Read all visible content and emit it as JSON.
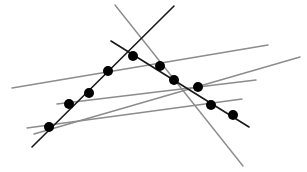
{
  "diagram": {
    "width": 307,
    "height": 172,
    "background": "#ffffff",
    "colors": {
      "dark_line": "#1a1a1a",
      "gray_line": "#8c8c8c",
      "point": "#000000"
    },
    "lines": [
      {
        "id": "dark-line-1",
        "kind": "dark",
        "x1": 32,
        "y1": 147,
        "x2": 174,
        "y2": 6
      },
      {
        "id": "dark-line-2",
        "kind": "dark",
        "x1": 111,
        "y1": 41,
        "x2": 249,
        "y2": 127
      },
      {
        "id": "gray-line-1",
        "kind": "gray",
        "x1": 115,
        "y1": 5,
        "x2": 243,
        "y2": 166
      },
      {
        "id": "gray-line-2",
        "kind": "gray",
        "x1": 12,
        "y1": 88,
        "x2": 268,
        "y2": 45
      },
      {
        "id": "gray-line-3",
        "kind": "gray",
        "x1": 34,
        "y1": 134,
        "x2": 300,
        "y2": 57
      },
      {
        "id": "gray-line-4",
        "kind": "gray",
        "x1": 57,
        "y1": 104,
        "x2": 256,
        "y2": 80
      },
      {
        "id": "gray-line-5",
        "kind": "gray",
        "x1": 27,
        "y1": 128,
        "x2": 242,
        "y2": 99
      }
    ],
    "points": [
      {
        "x": 49,
        "y": 127
      },
      {
        "x": 69,
        "y": 104
      },
      {
        "x": 89,
        "y": 93
      },
      {
        "x": 108,
        "y": 71
      },
      {
        "x": 133,
        "y": 56
      },
      {
        "x": 160,
        "y": 66
      },
      {
        "x": 174,
        "y": 80
      },
      {
        "x": 198,
        "y": 87
      },
      {
        "x": 211,
        "y": 105
      },
      {
        "x": 233,
        "y": 115
      }
    ],
    "point_radius": 5
  }
}
